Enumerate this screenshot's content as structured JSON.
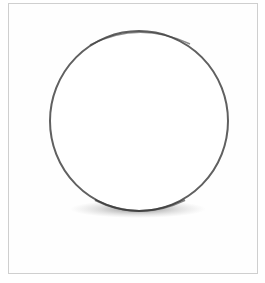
{
  "image": {
    "subject": "pencil sketch of a sphere outline with cast shadow",
    "colors": {
      "background": "#ffffff",
      "frame": "#cfcfcf",
      "stroke": "#5a5a5a",
      "shadow": "#6e6e6e"
    }
  }
}
